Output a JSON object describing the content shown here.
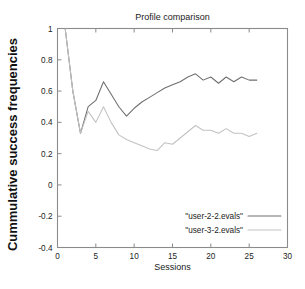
{
  "chart_data": {
    "type": "line",
    "title": "Profile comparison",
    "xlabel": "Sessions",
    "ylabel": "Cummulative success frequencies",
    "xlim": [
      0,
      30
    ],
    "ylim": [
      -0.4,
      1.0
    ],
    "xticks": [
      0,
      5,
      10,
      15,
      20,
      25,
      30
    ],
    "xtick_labels": [
      "0",
      "5",
      "10",
      "15",
      "20",
      "25",
      "30"
    ],
    "yticks": [
      -0.4,
      -0.2,
      0,
      0.2,
      0.4,
      0.6,
      0.8,
      1
    ],
    "ytick_labels": [
      "-0.4",
      "-0.2",
      "0",
      "0.2",
      "0.4",
      "0.6",
      "0.8",
      "1"
    ],
    "grid": false,
    "legend_position": "bottom-right",
    "x": [
      1,
      2,
      3,
      4,
      5,
      6,
      7,
      8,
      9,
      10,
      11,
      12,
      13,
      14,
      15,
      16,
      17,
      18,
      19,
      20,
      21,
      22,
      23,
      24,
      25,
      26
    ],
    "series": [
      {
        "name": "\"user-2-2.evals\"",
        "color": "#6e6e6e",
        "values": [
          1.0,
          0.6,
          0.33,
          0.5,
          0.54,
          0.66,
          0.58,
          0.5,
          0.44,
          0.49,
          0.53,
          0.56,
          0.59,
          0.62,
          0.64,
          0.66,
          0.69,
          0.71,
          0.67,
          0.69,
          0.65,
          0.69,
          0.66,
          0.69,
          0.67,
          0.67
        ]
      },
      {
        "name": "\"user-3-2.evals\"",
        "color": "#c2c2c2",
        "values": [
          1.0,
          0.6,
          0.33,
          0.47,
          0.4,
          0.5,
          0.4,
          0.32,
          0.29,
          0.27,
          0.25,
          0.23,
          0.22,
          0.27,
          0.26,
          0.3,
          0.34,
          0.38,
          0.35,
          0.35,
          0.33,
          0.36,
          0.33,
          0.33,
          0.31,
          0.33
        ]
      }
    ]
  }
}
